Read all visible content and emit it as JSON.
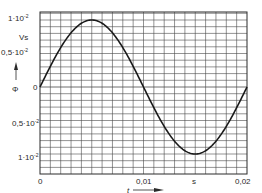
{
  "chart_data": {
    "type": "line",
    "title": "",
    "xlabel": "t",
    "xunit": "s",
    "ylabel": "Φ",
    "yunit": "Vs",
    "xlim": [
      0,
      0.02
    ],
    "ylim": [
      -0.011,
      0.011
    ],
    "grid": true,
    "legend": null,
    "x_ticks": [
      {
        "value": 0,
        "label": "0"
      },
      {
        "value": 0.01,
        "label": "0,01"
      },
      {
        "value": 0.02,
        "label": "0,02"
      }
    ],
    "y_ticks": [
      {
        "value": 0.01,
        "label": "1·10",
        "exp": "-2"
      },
      {
        "value": 0.005,
        "label": "0,5·10",
        "exp": "-2"
      },
      {
        "value": 0,
        "label": "0"
      },
      {
        "value": -0.005,
        "label": "0,5·10",
        "exp": "-2"
      },
      {
        "value": -0.01,
        "label": "1·10",
        "exp": "-2"
      }
    ],
    "series": [
      {
        "name": "Φ(t)",
        "function": "0.01*sin(2*pi*50*t)",
        "x": [
          0,
          0.0025,
          0.005,
          0.0075,
          0.01,
          0.0125,
          0.015,
          0.0175,
          0.02
        ],
        "y": [
          0,
          0.00707,
          0.01,
          0.00707,
          0,
          -0.00707,
          -0.01,
          -0.00707,
          0
        ]
      }
    ]
  },
  "labels": {
    "y_top": "1·10",
    "y_top_exp": "-2",
    "y_unit": "Vs",
    "y_half": "0,5·10",
    "y_half_exp": "-2",
    "y_symbol": "Φ",
    "y_zero": "0",
    "y_neg_half": "0,5·10",
    "y_neg_half_exp": "-2",
    "y_neg_top": "1·10",
    "y_neg_top_exp": "-2",
    "x_zero": "0",
    "x_mid": "0,01",
    "x_unit": "s",
    "x_end": "0,02",
    "x_symbol": "t"
  },
  "colors": {
    "grid": "#4a4a4a",
    "curve": "#1a1a1a",
    "text": "#2a2a2a"
  }
}
